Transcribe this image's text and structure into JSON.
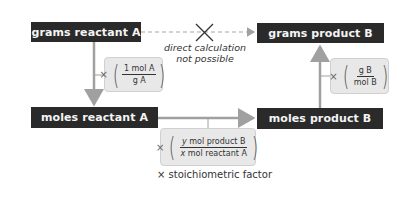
{
  "nodes": {
    "grams_reactant": "grams reactant A",
    "grams_product": "grams product B",
    "moles_reactant": "moles reactant A",
    "moles_product": "moles product B"
  },
  "direct_note": {
    "line1": "direct calculation",
    "line2": "not possible"
  },
  "factors": {
    "molar_mass_A": {
      "times": "×",
      "numerator": "1 mol A",
      "denominator": "g A"
    },
    "molar_mass_B": {
      "times": "×",
      "numerator": "g B",
      "denominator": "mol B"
    },
    "stoich": {
      "times": "×",
      "num_var": "y",
      "num_rest": " mol product B",
      "den_var": "x",
      "den_rest": " mol reactant A"
    }
  },
  "caption": "× stoichiometric factor",
  "colors": {
    "node_bg": "#2a2a2a",
    "node_text": "#f4f4f4",
    "factor_bg": "#e8e8e8",
    "arrow": "#a0a0a0"
  }
}
